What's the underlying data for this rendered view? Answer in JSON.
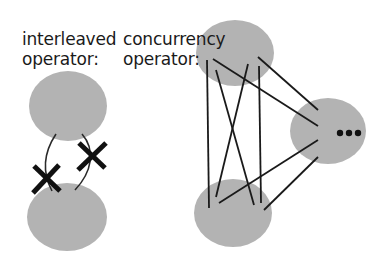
{
  "labels": {
    "interleaved_line1": "interleaved",
    "interleaved_line2": "operator:",
    "concurrency_line1": "concurrency",
    "concurrency_line2": "operator:"
  },
  "ellipsis": "•••",
  "colors": {
    "node_fill": "#b3b3b3",
    "line": "#1a1a1a",
    "cross": "#111111"
  }
}
